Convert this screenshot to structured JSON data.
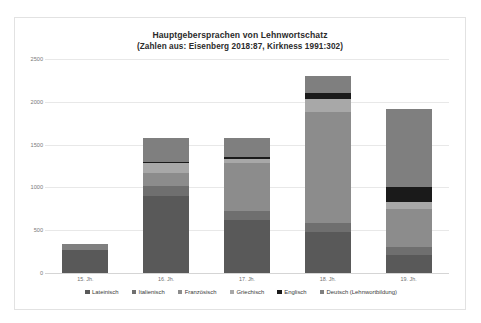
{
  "chart_data": {
    "type": "bar",
    "subtype": "stacked-bar",
    "title": "Hauptgebersprachen von Lehnwortschatz",
    "subtitle": "(Zahlen aus: Eisenberg 2018:87, Kirkness 1991:302)",
    "xlabel": "",
    "ylabel": "",
    "ylim": [
      0,
      2500
    ],
    "yticks": [
      0,
      500,
      1000,
      1500,
      2000,
      2500
    ],
    "ytick_labels": [
      "0",
      "500",
      "1000",
      "1500",
      "2000",
      "2500"
    ],
    "grid": true,
    "legend_position": "bottom",
    "categories": [
      "15. Jh.",
      "16. Jh.",
      "17. Jh.",
      "18. Jh.",
      "19. Jh."
    ],
    "series": [
      {
        "name": "Lateinisch",
        "color": "#595959",
        "values": [
          270,
          900,
          620,
          480,
          210
        ]
      },
      {
        "name": "Italienisch",
        "color": "#6f6f6f",
        "values": [
          0,
          120,
          110,
          110,
          90
        ]
      },
      {
        "name": "Französisch",
        "color": "#8c8c8c",
        "values": [
          0,
          150,
          560,
          1290,
          450
        ]
      },
      {
        "name": "Griechisch",
        "color": "#a8a8a8",
        "values": [
          0,
          110,
          40,
          150,
          80
        ]
      },
      {
        "name": "Englisch",
        "color": "#1a1a1a",
        "values": [
          0,
          20,
          20,
          70,
          170
        ]
      },
      {
        "name": "Deutsch (Lehnwortbildung)",
        "color": "#7f7f7f",
        "values": [
          70,
          280,
          230,
          200,
          920
        ]
      }
    ],
    "totals": [
      340,
      1580,
      1580,
      2300,
      1920
    ]
  },
  "legend": {
    "items": [
      {
        "label": "Lateinisch",
        "color": "#595959"
      },
      {
        "label": "Italienisch",
        "color": "#6f6f6f"
      },
      {
        "label": "Französisch",
        "color": "#8c8c8c"
      },
      {
        "label": "Griechisch",
        "color": "#a8a8a8"
      },
      {
        "label": "Englisch",
        "color": "#1a1a1a"
      },
      {
        "label": "Deutsch (Lehnwortbildung)",
        "color": "#7f7f7f"
      }
    ]
  },
  "colors": {
    "background": "#ffffff",
    "frame_border": "#e2e2e2",
    "gridline": "#e8e8e8",
    "tick_text": "#7a7a7a",
    "title_text": "#2b2b2b",
    "legend_text": "#3a3a3a"
  }
}
